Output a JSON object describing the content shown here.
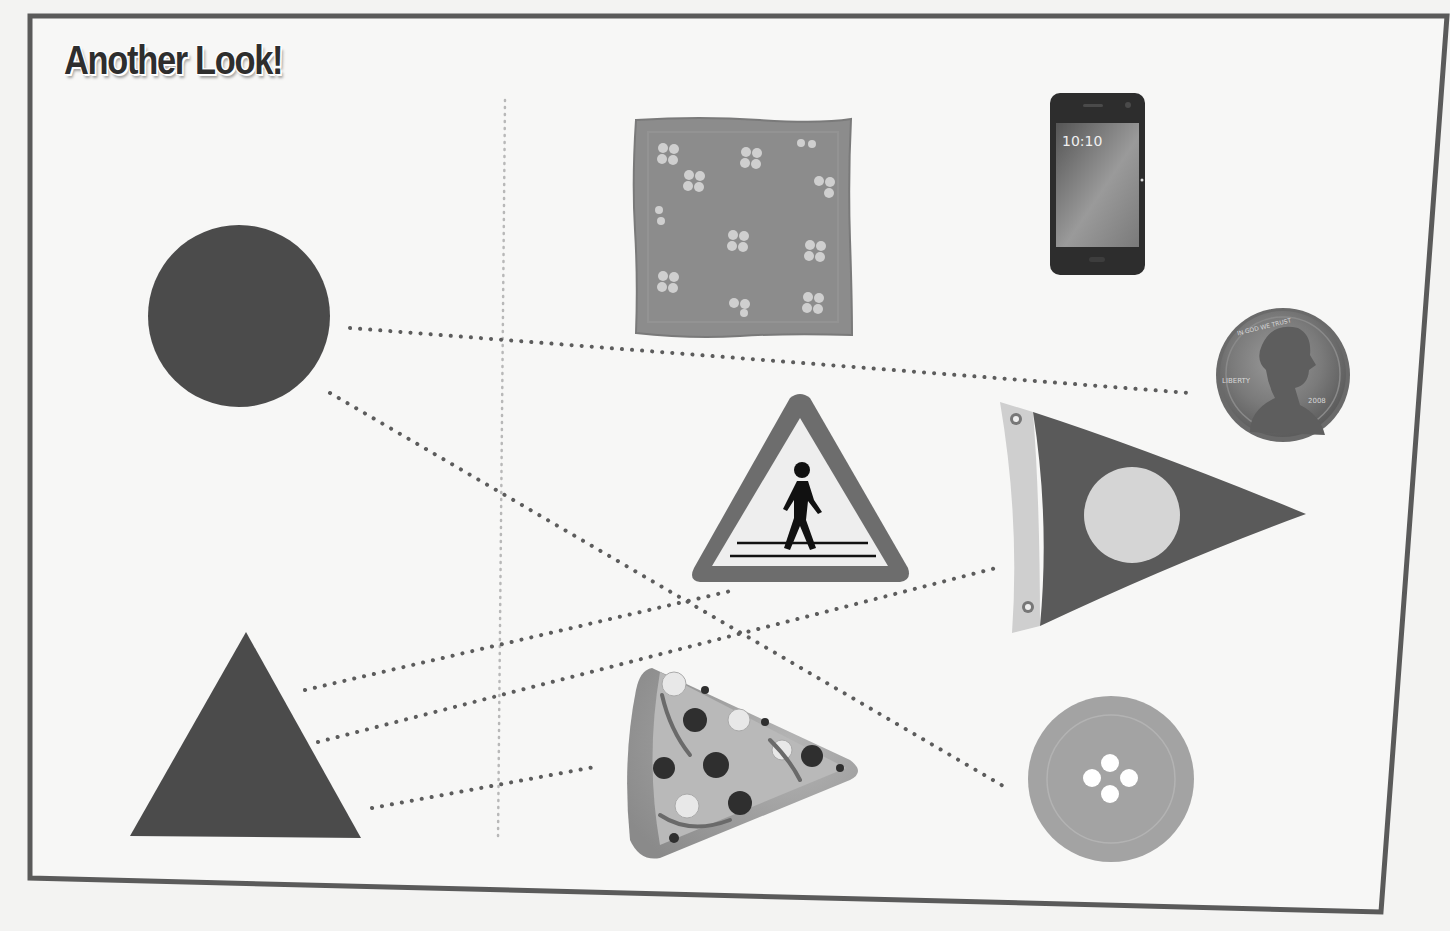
{
  "page": {
    "title": "Another Look!"
  },
  "colors": {
    "background": "#f3f3f2",
    "frame": "#5a5a5a",
    "shape_fill": "#4b4b4b",
    "dotted_line": "#5c5c5c",
    "divider": "#b8b8b8"
  },
  "shapes": [
    {
      "id": "circle",
      "label": "circle"
    },
    {
      "id": "triangle",
      "label": "triangle"
    }
  ],
  "objects": [
    {
      "id": "napkin",
      "label": "flowered napkin",
      "shape": "square"
    },
    {
      "id": "phone",
      "label": "smartphone",
      "shape": "rectangle",
      "screen_time": "10:10"
    },
    {
      "id": "penny",
      "label": "penny",
      "shape": "circle",
      "inscriptions": [
        "IN GOD WE TRUST",
        "LIBERTY",
        "2008"
      ]
    },
    {
      "id": "crossing-sign",
      "label": "pedestrian crossing sign",
      "shape": "triangle"
    },
    {
      "id": "pennant",
      "label": "pennant flag",
      "shape": "triangle"
    },
    {
      "id": "pizza",
      "label": "pizza slice",
      "shape": "triangle"
    },
    {
      "id": "button",
      "label": "sewing button",
      "shape": "circle"
    }
  ],
  "connections": [
    {
      "from": "circle",
      "to": "penny"
    },
    {
      "from": "circle",
      "to": "button"
    },
    {
      "from": "triangle",
      "to": "crossing-sign"
    },
    {
      "from": "triangle",
      "to": "pennant"
    },
    {
      "from": "triangle",
      "to": "pizza"
    }
  ]
}
